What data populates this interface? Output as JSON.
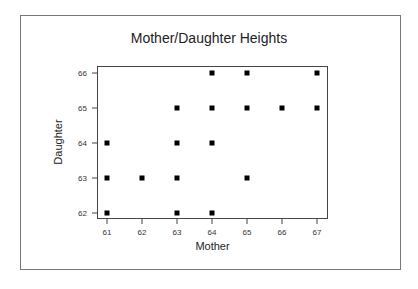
{
  "chart_data": {
    "type": "scatter",
    "title": "Mother/Daughter Heights",
    "xlabel": "Mother",
    "ylabel": "Daughter",
    "xlim": [
      61,
      67
    ],
    "ylim": [
      62,
      66
    ],
    "x_ticks": [
      61,
      62,
      63,
      64,
      65,
      66,
      67
    ],
    "y_ticks": [
      62,
      63,
      64,
      65,
      66
    ],
    "grid": false,
    "legend": null,
    "points": [
      {
        "x": 61,
        "y": 62
      },
      {
        "x": 61,
        "y": 63
      },
      {
        "x": 61,
        "y": 64
      },
      {
        "x": 62,
        "y": 63
      },
      {
        "x": 63,
        "y": 62
      },
      {
        "x": 63,
        "y": 63
      },
      {
        "x": 63,
        "y": 64
      },
      {
        "x": 63,
        "y": 65
      },
      {
        "x": 64,
        "y": 62
      },
      {
        "x": 64,
        "y": 64
      },
      {
        "x": 64,
        "y": 65
      },
      {
        "x": 64,
        "y": 66
      },
      {
        "x": 65,
        "y": 63
      },
      {
        "x": 65,
        "y": 65
      },
      {
        "x": 65,
        "y": 66
      },
      {
        "x": 66,
        "y": 65
      },
      {
        "x": 67,
        "y": 65
      },
      {
        "x": 67,
        "y": 66
      }
    ],
    "marker_color": "#000000"
  }
}
